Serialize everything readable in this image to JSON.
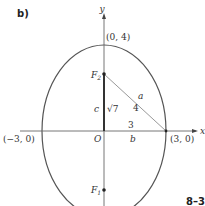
{
  "panel_label": "b)",
  "corner_text": "8–3",
  "axes": {
    "x_label": "x",
    "y_label": "y",
    "origin_label": "O"
  },
  "points": {
    "top": "(0, 4)",
    "left": "(−3, 0)",
    "right": "(3, 0)",
    "focus_upper": "F",
    "focus_upper_sub": "2",
    "focus_lower": "F",
    "focus_lower_sub": "1"
  },
  "triangle": {
    "hyp_var": "a",
    "hyp_val": "4",
    "vert_var": "c",
    "vert_val": "√7",
    "horiz_var": "b",
    "horiz_val": "3"
  },
  "colors": {
    "ellipse": "#555555",
    "axis": "#555555",
    "segment_c": "#333333",
    "hyp": "#888888"
  }
}
